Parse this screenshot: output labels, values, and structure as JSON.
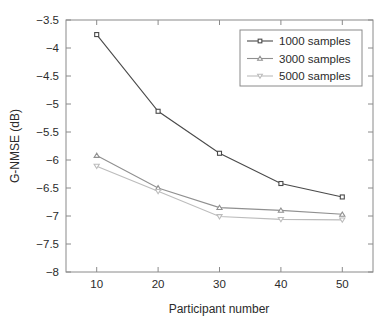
{
  "chart_data": {
    "type": "line",
    "title": "",
    "xlabel": "Participant number",
    "ylabel": "G-NMSE (dB)",
    "x": [
      10,
      20,
      30,
      40,
      50
    ],
    "xlim": [
      5,
      55
    ],
    "ylim": [
      -8,
      -3.5
    ],
    "xticks": [
      "10",
      "20",
      "30",
      "40",
      "50"
    ],
    "yticks": [
      "-3.5",
      "-4",
      "-4.5",
      "-5",
      "-5.5",
      "-6",
      "-6.5",
      "-7",
      "-7.5",
      "-8"
    ],
    "ytick_values": [
      -3.5,
      -4,
      -4.5,
      -5,
      -5.5,
      -6,
      -6.5,
      -7,
      -7.5,
      -8
    ],
    "grid": false,
    "legend_position": "upper right",
    "series": [
      {
        "name": "1000 samples",
        "marker": "square",
        "color": "#4a4a4a",
        "values": [
          -3.76,
          -5.13,
          -5.88,
          -6.42,
          -6.66
        ]
      },
      {
        "name": "3000 samples",
        "marker": "triangle-up",
        "color": "#909090",
        "values": [
          -5.92,
          -6.5,
          -6.85,
          -6.9,
          -6.97
        ]
      },
      {
        "name": "5000 samples",
        "marker": "triangle-down",
        "color": "#bcbcbc",
        "values": [
          -6.11,
          -6.56,
          -7.01,
          -7.06,
          -7.07
        ]
      }
    ]
  },
  "legend": {
    "items": [
      {
        "label": "1000 samples"
      },
      {
        "label": "3000 samples"
      },
      {
        "label": "5000 samples"
      }
    ]
  },
  "axes": {
    "x_title": "Participant number",
    "y_title": "G-NMSE (dB)",
    "x_tick_labels": [
      "10",
      "20",
      "30",
      "40",
      "50"
    ],
    "y_tick_labels": [
      "-3.5",
      "-4",
      "-4.5",
      "-5",
      "-5.5",
      "-6",
      "-6.5",
      "-7",
      "-7.5",
      "-8"
    ]
  },
  "colors": {
    "axis": "#8a8a8a",
    "text": "#2b2b2b",
    "series_1000": "#4a4a4a",
    "series_3000": "#909090",
    "series_5000": "#bcbcbc",
    "background": "#ffffff"
  }
}
